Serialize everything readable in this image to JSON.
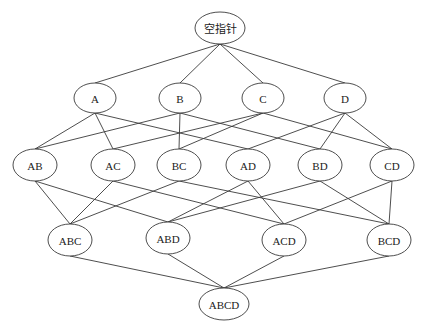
{
  "diagram": {
    "title": "",
    "type": "hasse-lattice",
    "colors": {
      "stroke": "#3a3a3a",
      "fill": "#ffffff",
      "text": "#222222"
    },
    "nodes": [
      {
        "id": "root",
        "label": "空指针",
        "x": 220,
        "y": 28,
        "rx": 25,
        "ry": 16
      },
      {
        "id": "A",
        "label": "A",
        "x": 95,
        "y": 98,
        "rx": 21,
        "ry": 15
      },
      {
        "id": "B",
        "label": "B",
        "x": 180,
        "y": 98,
        "rx": 21,
        "ry": 15
      },
      {
        "id": "C",
        "label": "C",
        "x": 263,
        "y": 98,
        "rx": 21,
        "ry": 15
      },
      {
        "id": "D",
        "label": "D",
        "x": 345,
        "y": 98,
        "rx": 21,
        "ry": 15
      },
      {
        "id": "AB",
        "label": "AB",
        "x": 35,
        "y": 165,
        "rx": 22,
        "ry": 16
      },
      {
        "id": "AC",
        "label": "AC",
        "x": 113,
        "y": 165,
        "rx": 22,
        "ry": 16
      },
      {
        "id": "BC",
        "label": "BC",
        "x": 179,
        "y": 165,
        "rx": 22,
        "ry": 16
      },
      {
        "id": "AD",
        "label": "AD",
        "x": 248,
        "y": 165,
        "rx": 22,
        "ry": 16
      },
      {
        "id": "BD",
        "label": "BD",
        "x": 320,
        "y": 165,
        "rx": 22,
        "ry": 16
      },
      {
        "id": "CD",
        "label": "CD",
        "x": 392,
        "y": 165,
        "rx": 22,
        "ry": 16
      },
      {
        "id": "ABC",
        "label": "ABC",
        "x": 70,
        "y": 240,
        "rx": 22,
        "ry": 16
      },
      {
        "id": "ABD",
        "label": "ABD",
        "x": 168,
        "y": 238,
        "rx": 22,
        "ry": 16
      },
      {
        "id": "ACD",
        "label": "ACD",
        "x": 284,
        "y": 240,
        "rx": 22,
        "ry": 16
      },
      {
        "id": "BCD",
        "label": "BCD",
        "x": 389,
        "y": 240,
        "rx": 22,
        "ry": 16
      },
      {
        "id": "ABCD",
        "label": "ABCD",
        "x": 224,
        "y": 304,
        "rx": 25,
        "ry": 16
      }
    ],
    "edges": [
      [
        "root",
        "A"
      ],
      [
        "root",
        "B"
      ],
      [
        "root",
        "C"
      ],
      [
        "root",
        "D"
      ],
      [
        "A",
        "AB"
      ],
      [
        "A",
        "AC"
      ],
      [
        "A",
        "AD"
      ],
      [
        "B",
        "AB"
      ],
      [
        "B",
        "BC"
      ],
      [
        "B",
        "BD"
      ],
      [
        "C",
        "AC"
      ],
      [
        "C",
        "BC"
      ],
      [
        "C",
        "CD"
      ],
      [
        "D",
        "AD"
      ],
      [
        "D",
        "BD"
      ],
      [
        "D",
        "CD"
      ],
      [
        "AB",
        "ABC"
      ],
      [
        "AB",
        "ABD"
      ],
      [
        "AC",
        "ABC"
      ],
      [
        "AC",
        "ACD"
      ],
      [
        "BC",
        "ABC"
      ],
      [
        "BC",
        "BCD"
      ],
      [
        "AD",
        "ABD"
      ],
      [
        "AD",
        "ACD"
      ],
      [
        "BD",
        "ABD"
      ],
      [
        "BD",
        "BCD"
      ],
      [
        "CD",
        "ACD"
      ],
      [
        "CD",
        "BCD"
      ],
      [
        "ABC",
        "ABCD"
      ],
      [
        "ABD",
        "ABCD"
      ],
      [
        "ACD",
        "ABCD"
      ],
      [
        "BCD",
        "ABCD"
      ]
    ]
  }
}
